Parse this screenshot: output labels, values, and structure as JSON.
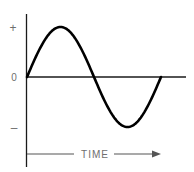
{
  "chart_data": {
    "type": "line",
    "title": "",
    "series": [
      {
        "name": "sine-wave",
        "function": "sin",
        "cycles": 1,
        "amplitude": 1,
        "phase_start": 0
      }
    ],
    "xlabel": "TIME",
    "ylabel": "",
    "y_tick_labels": [
      "+",
      "0",
      "–"
    ],
    "y_ticks": [
      1,
      0,
      -1
    ],
    "ylim": [
      -1.3,
      1.4
    ],
    "xlim": [
      0,
      1.22
    ],
    "grid": false,
    "legend": "none",
    "colors": {
      "wave": "#000000",
      "axis": "#1a1a1a",
      "labels": "#6e6e6e"
    }
  },
  "labels": {
    "plus": "+",
    "zero": "0",
    "minus": "–",
    "time": "TIME"
  }
}
